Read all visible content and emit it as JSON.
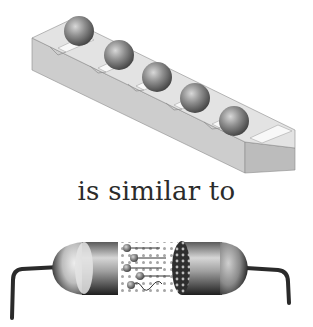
{
  "figure": {
    "top_illustration": {
      "label": "balls-in-grooved-bar",
      "ball_count": 5,
      "colors": {
        "bar_front": "#c9c9c9",
        "bar_top": "#e6e6e6",
        "groove": "#f7f7f7",
        "ball": "#8a8a8a"
      }
    },
    "caption": "is similar to",
    "bottom_illustration": {
      "label": "resistor-cutaway",
      "colors": {
        "body": "#9a9a9a",
        "lead": "#2a2a2a",
        "dots": "#9b9b9b",
        "band": "#3a3a3a"
      }
    }
  }
}
